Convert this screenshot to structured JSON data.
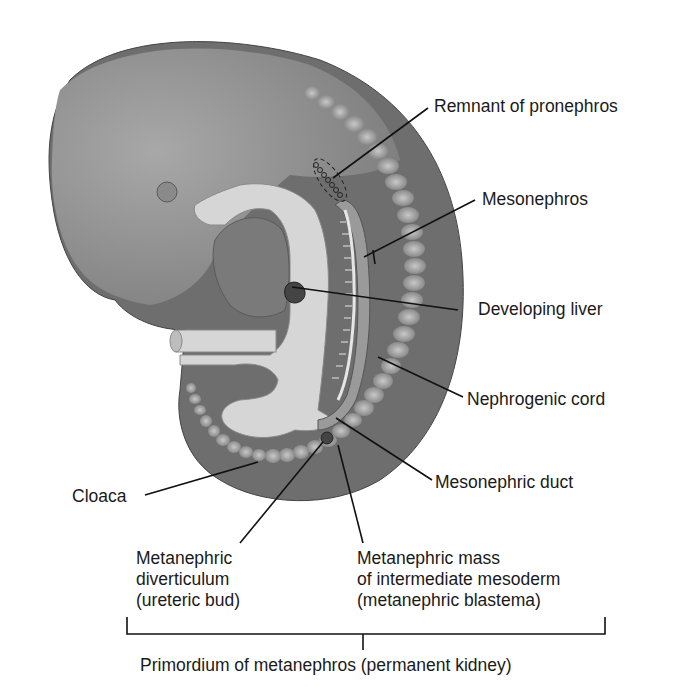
{
  "figure": {
    "colors": {
      "body": "#7d7d7d",
      "body_light": "#a6a6a6",
      "body_dark": "#5e5e5e",
      "gut": "#d6d6d6",
      "somite": "#b8b8b8",
      "line": "#111111"
    }
  },
  "labels": {
    "remnant_pronephros": "Remnant of pronephros",
    "mesonephros": "Mesonephros",
    "developing_liver": "Developing liver",
    "nephrogenic_cord": "Nephrogenic cord",
    "mesonephric_duct": "Mesonephric duct",
    "cloaca": "Cloaca",
    "metanephric_diverticulum": "Metanephric\ndiverticulum\n(ureteric bud)",
    "metanephric_mass": "Metanephric mass\nof intermediate mesoderm\n(metanephric blastema)",
    "primordium": "Primordium of metanephros (permanent kidney)"
  }
}
